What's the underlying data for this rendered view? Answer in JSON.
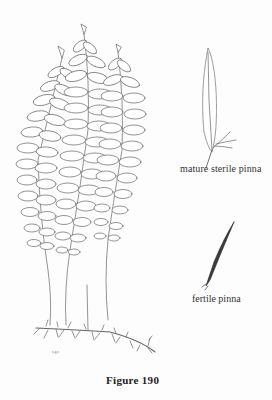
{
  "figure": {
    "label": "Figure 190",
    "signature": "s.g.r."
  },
  "illustrations": [
    {
      "name": "fern-plant",
      "description": "three pinnate fronds with creeping rhizome"
    },
    {
      "name": "mature-sterile-pinna",
      "caption": "mature sterile pinna"
    },
    {
      "name": "fertile-pinna",
      "caption": "fertile pinna"
    }
  ],
  "captions": {
    "sterile": "mature sterile pinna",
    "fertile": "fertile pinna"
  },
  "colors": {
    "ink": "#555555",
    "paper": "#fdfdfd",
    "text": "#333333"
  }
}
